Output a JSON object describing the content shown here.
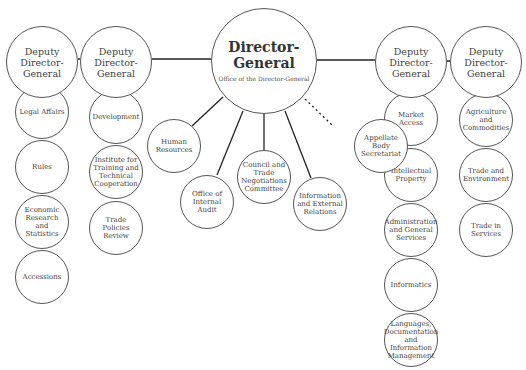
{
  "director_general": {
    "title": "Director-General",
    "subtitle": "Office of the Director-General",
    "cx": 264,
    "cy": 61,
    "r": 53
  },
  "deputies": [
    {
      "title": "Deputy Director-General",
      "cx": 42,
      "cy": 62,
      "r": 36,
      "units": [
        {
          "label": "Legal Affairs",
          "cy": 112
        },
        {
          "label": "Rules",
          "cy": 167
        },
        {
          "label": "Economic Research and Statistics",
          "cy": 222
        },
        {
          "label": "Accessions",
          "cy": 277
        }
      ]
    },
    {
      "title": "Deputy Director-General",
      "cx": 116,
      "cy": 62,
      "r": 36,
      "units": [
        {
          "label": "Development",
          "cy": 117
        },
        {
          "label": "Institute for Training and Technical Cooperation",
          "cy": 172
        },
        {
          "label": "Trade Policies Review",
          "cy": 228
        }
      ]
    },
    {
      "title": "Deputy Director-General",
      "cx": 411,
      "cy": 62,
      "r": 36,
      "units": [
        {
          "label": "Market Access",
          "cy": 119
        },
        {
          "label": "Intellectual Property",
          "cy": 175
        },
        {
          "label": "Administration and General Services",
          "cy": 230
        },
        {
          "label": "Informatics",
          "cy": 285
        },
        {
          "label": "Languages, Documentation and Information Management",
          "cy": 340
        }
      ]
    },
    {
      "title": "Deputy Director-General",
      "cx": 486,
      "cy": 62,
      "r": 36,
      "units": [
        {
          "label": "Agriculture and Commodities",
          "cy": 120
        },
        {
          "label": "Trade and Environment",
          "cy": 175
        },
        {
          "label": "Trade in Services",
          "cy": 230
        }
      ]
    }
  ],
  "dg_units": [
    {
      "label": "Human Resources",
      "cx": 174,
      "cy": 146,
      "r": 27,
      "dashed": false
    },
    {
      "label": "Office of Internal Audit",
      "cx": 207,
      "cy": 202,
      "r": 27,
      "dashed": false
    },
    {
      "label": "Council and Trade Negotiations Committee",
      "cx": 264,
      "cy": 177,
      "r": 27,
      "dashed": false
    },
    {
      "label": "Information and External Relations",
      "cx": 320,
      "cy": 204,
      "r": 27,
      "dashed": false
    },
    {
      "label": "Appellate Body Secretariat",
      "cx": 381,
      "cy": 146,
      "r": 27,
      "dashed": true
    }
  ],
  "unit_radius": 27,
  "colors": {
    "stroke": "#555555",
    "line": "#222222",
    "text": "#444444"
  }
}
